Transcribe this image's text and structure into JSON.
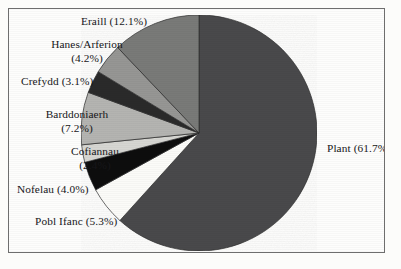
{
  "figure": {
    "border_color": "#6e6e6e",
    "background": "#fdfdfc",
    "cutoff_caption": ""
  },
  "chart_data": {
    "type": "pie",
    "title": "",
    "xlabel": "",
    "ylabel": "",
    "legend_position": "none",
    "labels_outside": true,
    "grid": false,
    "start_angle_deg": 0,
    "direction": "clockwise",
    "categories": [
      "Plant",
      "Pobl Ifanc",
      "Nofelau",
      "Cofiannau",
      "Barddoniaerh",
      "Crefydd",
      "Hanes/Arferion",
      "Eraill"
    ],
    "values": [
      61.7,
      5.3,
      4.0,
      2.4,
      7.2,
      3.1,
      4.2,
      12.1
    ],
    "units": "%",
    "colors": [
      "#4a4a4c",
      "#fbfbf8",
      "#0d0d0e",
      "#d6d6d2",
      "#b4b4b1",
      "#2a2a2c",
      "#969694",
      "#797a78"
    ],
    "slices": [
      {
        "label": "Plant",
        "value": 61.7,
        "color": "#4a4a4c",
        "label_text": "Plant (61.7%)"
      },
      {
        "label": "Pobl Ifanc",
        "value": 5.3,
        "color": "#fbfbf8",
        "label_text": "Pobl Ifanc (5.3%)"
      },
      {
        "label": "Nofelau",
        "value": 4.0,
        "color": "#0d0d0e",
        "label_text": "Nofelau (4.0%)"
      },
      {
        "label": "Cofiannau",
        "value": 2.4,
        "color": "#d6d6d2",
        "label_text": "Cofiannau\n(2.4%)"
      },
      {
        "label": "Barddoniaerh",
        "value": 7.2,
        "color": "#b4b4b1",
        "label_text": "Barddoniaerh\n(7.2%)"
      },
      {
        "label": "Crefydd",
        "value": 3.1,
        "color": "#2a2a2c",
        "label_text": "Crefydd (3.1%)"
      },
      {
        "label": "Hanes/Arferion",
        "value": 4.2,
        "color": "#969694",
        "label_text": "Hanes/Arferion\n(4.2%)"
      },
      {
        "label": "Eraill",
        "value": 12.1,
        "color": "#797a78",
        "label_text": "Eraill (12.1%)"
      }
    ]
  },
  "labels": {
    "eraill": "Eraill (12.1%)",
    "hanes_line1": "Hanes/Arferion",
    "hanes_line2": "(4.2%)",
    "crefydd": "Crefydd (3.1%)",
    "barddoniaerh_line1": "Barddoniaerh",
    "barddoniaerh_line2": "(7.2%)",
    "cofiannau_line1": "Cofiannau",
    "cofiannau_line2": "(2.4%)",
    "nofelau": "Nofelau (4.0%)",
    "pobl_ifanc": "Pobl Ifanc (5.3%)",
    "plant": "Plant (61.7%)"
  }
}
